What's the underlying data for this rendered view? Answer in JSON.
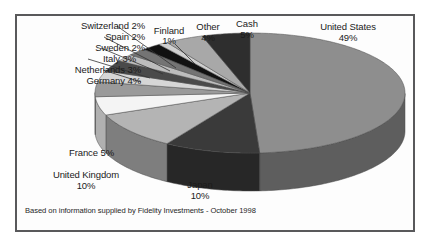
{
  "caption": "Based on information supplied by Fidelity Investments - October 1998",
  "colors": {
    "frame_border": "#59595b",
    "background": "#ffffff",
    "panel": "#fdfdfd",
    "text": "#1b1b1b"
  },
  "chart_data": {
    "type": "pie",
    "title": "",
    "subtitle": "",
    "xlabel": "",
    "ylabel": "",
    "legend_position": "none",
    "labels_position": "outside-with-leader-lines",
    "three_d": true,
    "start_angle_deg": -90,
    "direction": "clockwise",
    "units": "percent",
    "total": 100,
    "categories": [
      "United States",
      "Japan",
      "United Kingdom",
      "France",
      "Germany",
      "Netherlands",
      "Italy",
      "Sweden",
      "Spain",
      "Switzerland",
      "Finland",
      "Other",
      "Cash"
    ],
    "values": [
      49,
      10,
      10,
      5,
      4,
      3,
      3,
      2,
      2,
      2,
      1,
      4,
      5
    ],
    "slices": [
      {
        "label": "United States",
        "percent": 49,
        "value_text": "49%",
        "color": "#8e8e8e",
        "side_color": "#5e5e5e"
      },
      {
        "label": "Japan",
        "percent": 10,
        "value_text": "10%",
        "color": "#3a3a3a",
        "side_color": "#272727"
      },
      {
        "label": "United Kingdom",
        "percent": 10,
        "value_text": "10%",
        "color": "#b4b4b4",
        "side_color": "#7e7e7e"
      },
      {
        "label": "France",
        "percent": 5,
        "value_text": "5%",
        "color": "#f4f4f4",
        "side_color": "#b0b0b0"
      },
      {
        "label": "Germany",
        "percent": 4,
        "value_text": "4%",
        "color": "#9a9a9a",
        "side_color": "#6c6c6c"
      },
      {
        "label": "Netherlands",
        "percent": 3,
        "value_text": "3%",
        "color": "#d6d6d6",
        "side_color": "#9a9a9a"
      },
      {
        "label": "Italy",
        "percent": 3,
        "value_text": "3%",
        "color": "#4a4a4a",
        "side_color": "#343434"
      },
      {
        "label": "Sweden",
        "percent": 2,
        "value_text": "2%",
        "color": "#bdbdbd",
        "side_color": "#878787"
      },
      {
        "label": "Spain",
        "percent": 2,
        "value_text": "2%",
        "color": "#747474",
        "side_color": "#515151"
      },
      {
        "label": "Switzerland",
        "percent": 2,
        "value_text": "2%",
        "color": "#111111",
        "side_color": "#0b0b0b"
      },
      {
        "label": "Finland",
        "percent": 1,
        "value_text": "1%",
        "color": "#cfcfcf",
        "side_color": "#8f8f8f"
      },
      {
        "label": "Other",
        "percent": 4,
        "value_text": "4%",
        "color": "#a8a8a8",
        "side_color": "#757575"
      },
      {
        "label": "Cash",
        "percent": 5,
        "value_text": "5%",
        "color": "#2e2e2e",
        "side_color": "#1f1f1f"
      }
    ]
  },
  "labels": {
    "switzerland": {
      "name": "Switzerland",
      "pct": "2%",
      "text": "Switzerland 2%"
    },
    "spain": {
      "name": "Spain",
      "pct": "2%",
      "text": "Spain 2%"
    },
    "sweden": {
      "name": "Sweden",
      "pct": "2%",
      "text": "Sweden 2%"
    },
    "italy": {
      "name": "Italy",
      "pct": "3%",
      "text": "Italy 3%"
    },
    "netherlands": {
      "name": "Netherlands",
      "pct": "3%",
      "text": "Netherlands 3%"
    },
    "germany": {
      "name": "Germany",
      "pct": "4%",
      "text": "Germany 4%"
    },
    "finland": {
      "name": "Finland",
      "pct": "1%"
    },
    "other": {
      "name": "Other",
      "pct": "4%"
    },
    "cash": {
      "name": "Cash",
      "pct": "5%"
    },
    "united_states": {
      "name": "United States",
      "pct": "49%"
    },
    "japan": {
      "name": "Japan",
      "pct": "10%"
    },
    "united_kingdom": {
      "name": "United Kingdom",
      "pct": "10%"
    },
    "france": {
      "name": "France",
      "pct": "5%",
      "text": "France 5%"
    }
  }
}
